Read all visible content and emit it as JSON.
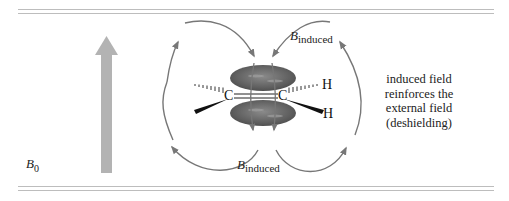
{
  "figure": {
    "external_field": {
      "symbol": "B",
      "subscript": "0",
      "arrow_color": "#b3b3b3"
    },
    "induced_labels": {
      "top": {
        "symbol": "B",
        "subscript": "induced"
      },
      "bottom": {
        "symbol": "B",
        "subscript": "induced"
      }
    },
    "molecule": {
      "atoms": {
        "carbon_left": "C",
        "carbon_right": "C",
        "hydrogen_top": "H",
        "hydrogen_bottom": "H"
      },
      "pi_lobe_color": "#6b6b6b",
      "field_line_color": "#777777"
    },
    "annotation": {
      "line1": "induced field",
      "line2": "reinforces the",
      "line3": "external field",
      "line4": "(deshielding)"
    }
  }
}
